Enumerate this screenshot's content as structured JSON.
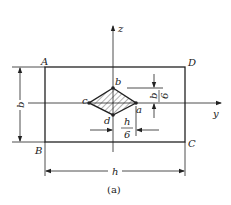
{
  "figure": {
    "caption": "(a)",
    "axes": {
      "vertical": "z",
      "horizontal": "y"
    },
    "corners": {
      "top_left": "A",
      "top_right": "D",
      "bottom_left": "B",
      "bottom_right": "C"
    },
    "kern_points": {
      "top": "b",
      "right": "a",
      "bottom": "d",
      "left": "c"
    },
    "dimensions": {
      "height": "b",
      "width": "h",
      "kern_half_height": {
        "numerator": "b",
        "denominator": "6"
      },
      "kern_half_width": {
        "numerator": "h",
        "denominator": "6"
      }
    },
    "colors": {
      "stroke": "#222222",
      "background": "#ffffff"
    }
  }
}
